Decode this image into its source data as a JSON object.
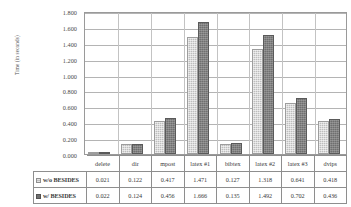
{
  "chart_data": {
    "type": "bar",
    "title": "",
    "xlabel": "",
    "ylabel": "Time (in seconds)",
    "ylim": [
      0,
      1.8
    ],
    "ytick_step": 0.2,
    "yticks": [
      "0.000",
      "0.200",
      "0.400",
      "0.600",
      "0.800",
      "1.000",
      "1.200",
      "1.400",
      "1.600",
      "1.800"
    ],
    "grid": true,
    "legend_position": "table-left",
    "categories": [
      "delete",
      "dir",
      "mpost",
      "latex #1",
      "bibtex",
      "latex #2",
      "latex #3",
      "dvips"
    ],
    "series": [
      {
        "name": "w/o BESIDES",
        "color": "#bdbdbd",
        "values": [
          0.021,
          0.122,
          0.417,
          1.471,
          0.127,
          1.318,
          0.641,
          0.418
        ],
        "labels": [
          "0.021",
          "0.122",
          "0.417",
          "1.471",
          "0.127",
          "1.318",
          "0.641",
          "0.418"
        ]
      },
      {
        "name": "w/ BESIDES",
        "color": "#6f6f6f",
        "values": [
          0.022,
          0.124,
          0.456,
          1.666,
          0.135,
          1.492,
          0.702,
          0.436
        ],
        "labels": [
          "0.022",
          "0.124",
          "0.456",
          "1.666",
          "0.135",
          "1.492",
          "0.702",
          "0.436"
        ]
      }
    ]
  }
}
